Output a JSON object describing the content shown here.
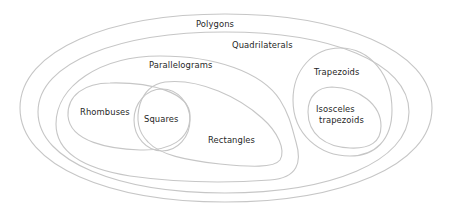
{
  "diagram": {
    "type": "euler-venn",
    "line_color": "#c6c6c6",
    "text_color": "#1f1f1f",
    "background": "#ffffff",
    "sets": {
      "polygons": {
        "label": "Polygons"
      },
      "quadrilaterals": {
        "label": "Quadrilaterals"
      },
      "parallelograms": {
        "label": "Parallelograms"
      },
      "rhombuses": {
        "label": "Rhombuses"
      },
      "squares": {
        "label": "Squares"
      },
      "rectangles": {
        "label": "Rectangles"
      },
      "trapezoids": {
        "label": "Trapezoids"
      },
      "isosceles_trapezoids": {
        "label_line1": "Isosceles",
        "label_line2": "trapezoids"
      }
    },
    "relations": [
      "Quadrilaterals ⊂ Polygons",
      "Parallelograms ⊂ Quadrilaterals",
      "Trapezoids ⊂ Quadrilaterals",
      "Rhombuses ⊂ Parallelograms",
      "Rectangles ⊂ Parallelograms",
      "Squares = Rhombuses ∩ Rectangles",
      "Isosceles trapezoids ⊂ Trapezoids"
    ]
  }
}
